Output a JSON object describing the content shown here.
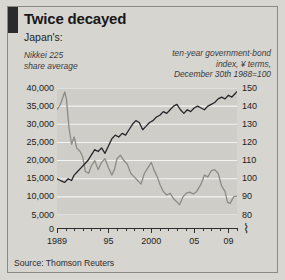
{
  "figure": {
    "title": "Twice decayed",
    "subject": "Japan's:",
    "note_left": "Nikkei 225\nshare average",
    "note_right": "ten-year government-bond\nindex, ¥ terms,\nDecember 30th 1988=100",
    "source": "Source: Thomson Reuters",
    "axis_break_symbol": "⌇",
    "zero_label": "0",
    "colors": {
      "background": "#d7d5d0",
      "plot_background": "#cfcdc8",
      "gridline": "#f4f3f1",
      "nikkei_line": "#8e8b86",
      "bond_line": "#26262a",
      "axis": "#2e2e30",
      "title_marker": "#2b2b2b"
    }
  },
  "chart_data": {
    "type": "line",
    "title": "Twice decayed",
    "xlabel": "",
    "ylabel": "Nikkei 225 share average",
    "y2label": "ten-year government-bond index, ¥ terms, December 30th 1988=100",
    "grid": true,
    "legend": "inline-labels",
    "xlim": [
      1989,
      2010
    ],
    "xticks": [
      1989,
      1995,
      2000,
      2005,
      2009
    ],
    "xticklabels": [
      "1989",
      "95",
      "2000",
      "05",
      "09"
    ],
    "ylim": [
      5000,
      40000
    ],
    "yticks": [
      5000,
      10000,
      15000,
      20000,
      25000,
      30000,
      35000,
      40000
    ],
    "yticklabels": [
      "5,000",
      "10,000",
      "15,000",
      "20,000",
      "25,000",
      "30,000",
      "35,000",
      "40,000"
    ],
    "y2lim": [
      80,
      150
    ],
    "y2ticks": [
      80,
      90,
      100,
      110,
      120,
      130,
      140,
      150
    ],
    "y2ticklabels": [
      "80",
      "90",
      "100",
      "110",
      "120",
      "130",
      "140",
      "150"
    ],
    "series": [
      {
        "name": "Nikkei 225 share average",
        "axis": "left",
        "color": "#8e8b86",
        "x": [
          1989.0,
          1989.4,
          1989.9,
          1990.1,
          1990.4,
          1990.7,
          1991.0,
          1991.3,
          1991.7,
          1992.0,
          1992.3,
          1992.7,
          1993.0,
          1993.4,
          1993.8,
          1994.2,
          1994.6,
          1995.0,
          1995.4,
          1995.7,
          1996.0,
          1996.4,
          1996.8,
          1997.2,
          1997.6,
          1998.0,
          1998.4,
          1998.8,
          1999.2,
          1999.6,
          2000.0,
          2000.3,
          2000.7,
          2001.0,
          2001.4,
          2001.8,
          2002.2,
          2002.6,
          2003.0,
          2003.3,
          2003.7,
          2004.1,
          2004.5,
          2004.9,
          2005.3,
          2005.8,
          2006.2,
          2006.6,
          2007.0,
          2007.4,
          2007.8,
          2008.2,
          2008.6,
          2008.9,
          2009.2,
          2009.6,
          2010.0
        ],
        "y": [
          34000,
          35500,
          38900,
          37000,
          29000,
          24500,
          26500,
          23500,
          22500,
          21000,
          17000,
          16500,
          18500,
          20000,
          17500,
          19500,
          20500,
          18000,
          16000,
          17500,
          20500,
          21500,
          20000,
          19000,
          16500,
          15500,
          14500,
          13500,
          16500,
          18000,
          19500,
          17500,
          15500,
          13500,
          11500,
          10500,
          11000,
          9500,
          8600,
          7800,
          10000,
          11000,
          11300,
          10800,
          11500,
          13500,
          16000,
          15500,
          17200,
          17500,
          16500,
          13000,
          11500,
          8500,
          8200,
          10000,
          10200
        ]
      },
      {
        "name": "ten-year government-bond index",
        "axis": "right",
        "color": "#26262a",
        "x": [
          1989.0,
          1989.4,
          1989.9,
          1990.3,
          1990.7,
          1991.0,
          1991.4,
          1991.8,
          1992.2,
          1992.6,
          1993.0,
          1993.4,
          1993.8,
          1994.2,
          1994.6,
          1995.0,
          1995.4,
          1995.8,
          1996.2,
          1996.6,
          1997.0,
          1997.4,
          1997.8,
          1998.2,
          1998.6,
          1999.0,
          1999.4,
          1999.8,
          2000.2,
          2000.6,
          2001.0,
          2001.4,
          2001.8,
          2002.2,
          2002.6,
          2003.0,
          2003.4,
          2003.8,
          2004.2,
          2004.6,
          2005.0,
          2005.4,
          2005.8,
          2006.2,
          2006.6,
          2007.0,
          2007.4,
          2007.8,
          2008.2,
          2008.6,
          2009.0,
          2009.4,
          2009.8,
          2010.0
        ],
        "y": [
          100,
          99,
          98,
          100,
          99,
          102,
          104,
          106,
          108,
          110,
          113,
          116,
          115,
          117,
          114,
          118,
          122,
          124,
          123,
          125,
          124,
          127,
          130,
          132,
          131,
          127,
          129,
          131,
          132,
          134,
          135,
          137,
          136,
          138,
          140,
          141,
          138,
          136,
          138,
          137,
          139,
          140,
          139,
          138,
          140,
          141,
          142,
          144,
          145,
          144,
          146,
          145,
          147,
          148
        ]
      }
    ],
    "annotations": [
      {
        "text": "axis break on x-axis at right end",
        "symbol": "⌇"
      }
    ]
  }
}
